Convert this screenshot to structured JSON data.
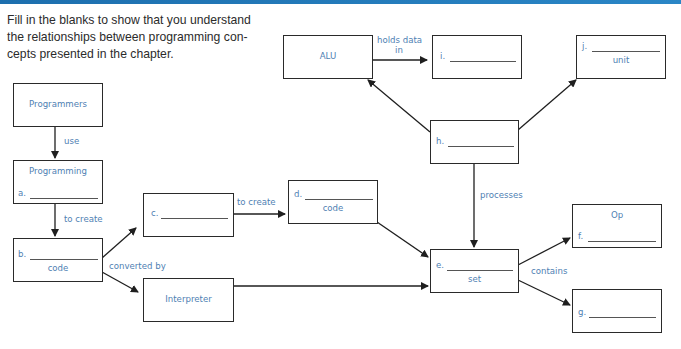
{
  "header": {
    "accent_color": "#1d6fae"
  },
  "instructions": "Fill in the blanks to show that you understand the relationships between programming con-cepts presented in the chapter.",
  "nodes": {
    "programmers": {
      "title": "Programmers"
    },
    "programming": {
      "title": "Programming",
      "blank_label": "a."
    },
    "b": {
      "blank_label": "b.",
      "suffix": "code"
    },
    "c": {
      "blank_label": "c."
    },
    "interpreter": {
      "title": "Interpreter"
    },
    "d": {
      "blank_label": "d.",
      "suffix": "code"
    },
    "e": {
      "blank_label": "e.",
      "suffix": "set"
    },
    "f": {
      "title": "Op",
      "blank_label": "f."
    },
    "g": {
      "blank_label": "g."
    },
    "h": {
      "blank_label": "h."
    },
    "alu": {
      "title": "ALU"
    },
    "i": {
      "blank_label": "i."
    },
    "j": {
      "blank_label": "j.",
      "suffix": "unit"
    }
  },
  "edges": {
    "use": "use",
    "to_create_1": "to create",
    "converted_by": "converted by",
    "to_create_2": "to create",
    "processes": "processes",
    "contains": "contains",
    "holds_data_in_1": "holds data",
    "holds_data_in_2": "in"
  },
  "colors": {
    "label_blue": "#4f7fb3",
    "line": "#2a2a2a"
  }
}
